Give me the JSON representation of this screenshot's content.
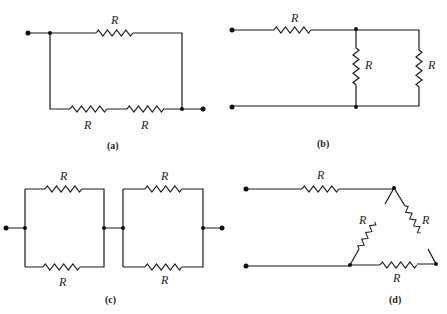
{
  "figure": {
    "resistor_label": "R",
    "panels": [
      {
        "id": "a",
        "caption": "(a)",
        "resistors": [
          "R",
          "R",
          "R"
        ],
        "topology": "R in parallel with two R in series"
      },
      {
        "id": "b",
        "caption": "(b)",
        "resistors": [
          "R",
          "R",
          "R"
        ],
        "topology": "R in series with two R in parallel"
      },
      {
        "id": "c",
        "caption": "(c)",
        "resistors": [
          "R",
          "R",
          "R",
          "R"
        ],
        "topology": "two parallel pairs in series"
      },
      {
        "id": "d",
        "caption": "(d)",
        "resistors": [
          "R",
          "R",
          "R",
          "R"
        ],
        "topology": "R in series with a delta network"
      }
    ]
  },
  "colors": {
    "line": "#1a1a1a",
    "background": "#ffffff"
  }
}
